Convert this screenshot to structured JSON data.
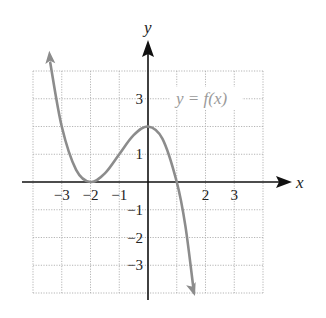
{
  "chart_data": {
    "type": "line",
    "title": "",
    "xlabel": "x",
    "ylabel": "y",
    "curve_label": "y = f(x)",
    "xlim": [
      -4,
      4
    ],
    "ylim": [
      -4,
      4
    ],
    "grid": true,
    "grid_style": "dotted",
    "x_ticks": [
      -3,
      -2,
      -1,
      2,
      3
    ],
    "x_tick_labels": [
      "−3",
      "−2",
      "−1",
      "2",
      "3"
    ],
    "y_ticks": [
      3,
      1,
      -1,
      -2,
      -3
    ],
    "y_tick_labels": [
      "3",
      "1",
      "−1",
      "−2",
      "−3"
    ],
    "series": [
      {
        "name": "f(x)",
        "color": "#8c8c8c",
        "description": "cubic-like curve: decreasing from upper left, touches x-axis at x=-2 (local min), local max of 2 at x=0, crosses x-axis near x=1, decreasing to lower right; arrows at both ends",
        "x": [
          -3.4,
          -3.0,
          -2.5,
          -2.0,
          -1.5,
          -1.0,
          -0.5,
          0.0,
          0.5,
          1.0,
          1.3,
          1.6
        ],
        "y": [
          4.3,
          2.0,
          0.44,
          0.0,
          0.31,
          1.0,
          1.69,
          2.0,
          1.56,
          0.0,
          -1.58,
          -4.0
        ]
      }
    ],
    "colors": {
      "axis": "#111111",
      "grid": "#b5b5b5",
      "curve": "#8c8c8c",
      "label": "#9a9a9a"
    }
  }
}
